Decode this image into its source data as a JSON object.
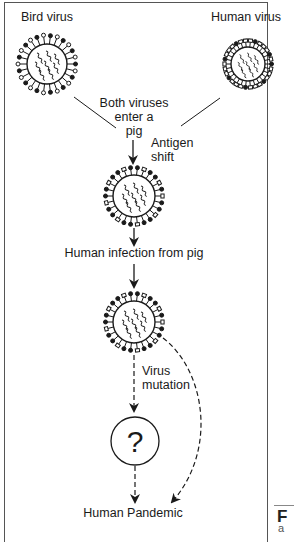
{
  "diagram": {
    "nodes": {
      "bird_virus": {
        "label": "Bird virus"
      },
      "human_virus": {
        "label": "Human virus"
      },
      "pig_mix": {
        "label_lines": [
          "Both viruses",
          "enter a",
          "pig"
        ]
      },
      "antigen_shift": {
        "label_lines": [
          "Antigen",
          "shift"
        ]
      },
      "human_infection": {
        "label": "Human infection from pig"
      },
      "virus_mutation": {
        "label_lines": [
          "Virus",
          "mutation"
        ]
      },
      "unknown": {
        "label": "?"
      },
      "pandemic": {
        "label": "Human Pandemic"
      }
    },
    "edges": [
      {
        "from": "bird_virus",
        "to": "pig_mix",
        "style": "solid"
      },
      {
        "from": "human_virus",
        "to": "pig_mix",
        "style": "solid"
      },
      {
        "from": "pig_mix",
        "to": "reassortant_virus",
        "style": "solid-arrow"
      },
      {
        "from": "reassortant_virus",
        "to": "human_infection",
        "style": "solid-arrow"
      },
      {
        "from": "human_infection",
        "to": "human_adapted_virus",
        "style": "solid-arrow"
      },
      {
        "from": "human_adapted_virus",
        "to": "unknown",
        "style": "dashed-arrow"
      },
      {
        "from": "unknown",
        "to": "pandemic",
        "style": "dashed-arrow"
      },
      {
        "from": "human_adapted_virus",
        "to": "pandemic",
        "style": "dashed-curved-arrow"
      }
    ]
  },
  "page_edge": {
    "figure_letter": "F",
    "sub_letter": "a"
  }
}
